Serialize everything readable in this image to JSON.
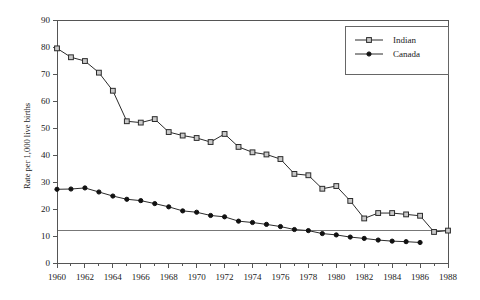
{
  "chart_data": {
    "type": "line",
    "title": "",
    "xlabel": "",
    "ylabel": "Rate per 1,000 live births",
    "xlim": [
      1960,
      1988
    ],
    "ylim": [
      0,
      90
    ],
    "yticks": [
      0,
      10,
      20,
      30,
      40,
      50,
      60,
      70,
      80,
      90
    ],
    "xticks": [
      1960,
      1962,
      1964,
      1966,
      1968,
      1970,
      1972,
      1974,
      1976,
      1978,
      1980,
      1982,
      1984,
      1986,
      1988
    ],
    "x_minor_tick_step": 1,
    "grid": false,
    "legend_position": "top-right",
    "reference_line": {
      "orientation": "horizontal",
      "value": 12,
      "color": "#777777"
    },
    "series": [
      {
        "name": "Indian",
        "marker": "open-square",
        "color": "#2b2b2b",
        "x": [
          1960,
          1961,
          1962,
          1963,
          1964,
          1965,
          1966,
          1967,
          1968,
          1969,
          1970,
          1971,
          1972,
          1973,
          1974,
          1975,
          1976,
          1977,
          1978,
          1979,
          1980,
          1981,
          1982,
          1983,
          1984,
          1985,
          1986,
          1987,
          1988
        ],
        "values": [
          79.5,
          76.2,
          74.8,
          70.5,
          63.8,
          52.5,
          52.0,
          53.3,
          48.5,
          47.2,
          46.3,
          44.8,
          47.8,
          43.0,
          41.0,
          40.2,
          38.5,
          33.0,
          32.5,
          27.5,
          28.5,
          23.0,
          16.5,
          18.5,
          18.5,
          18.0,
          17.5,
          11.5,
          12.0
        ]
      },
      {
        "name": "Canada",
        "marker": "filled-circle",
        "color": "#111111",
        "x": [
          1960,
          1961,
          1962,
          1963,
          1964,
          1965,
          1966,
          1967,
          1968,
          1969,
          1970,
          1971,
          1972,
          1973,
          1974,
          1975,
          1976,
          1977,
          1978,
          1979,
          1980,
          1981,
          1982,
          1983,
          1984,
          1985,
          1986
        ],
        "values": [
          27.3,
          27.4,
          27.8,
          26.3,
          24.8,
          23.6,
          23.1,
          22.0,
          20.8,
          19.3,
          18.8,
          17.6,
          17.1,
          15.5,
          15.0,
          14.3,
          13.5,
          12.4,
          12.0,
          10.9,
          10.4,
          9.6,
          9.1,
          8.5,
          8.1,
          7.9,
          7.6
        ]
      }
    ]
  },
  "legend": {
    "entries": [
      {
        "label": "Indian"
      },
      {
        "label": "Canada"
      }
    ]
  }
}
